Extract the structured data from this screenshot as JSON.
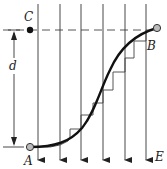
{
  "diagram": {
    "type": "brachistochrone-light-refraction",
    "labels": {
      "point_a": "A",
      "point_b": "B",
      "point_c": "C",
      "distance": "d",
      "field": "E"
    },
    "vertical_lines_count": 6,
    "colors": {
      "stroke": "#222222",
      "thin": "#444444",
      "point_fill": "#bbbbbb",
      "point_c_fill": "#111111",
      "background": "#ffffff"
    }
  }
}
